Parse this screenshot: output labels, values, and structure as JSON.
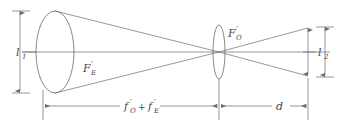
{
  "figure": {
    "name": "optical-ray-diagram",
    "background_color": "#ffffff",
    "line_color": "#6b6b6b",
    "label_color": "#4a4a4a"
  },
  "labels": {
    "left_height": {
      "base": "l",
      "sub": "1",
      "prime": ""
    },
    "right_height": {
      "base": "l",
      "sub": "2",
      "prime": ""
    },
    "eyepiece_focus": {
      "base": "F",
      "prime": "′",
      "sub": "E"
    },
    "objective_focus": {
      "base": "F",
      "prime": "′",
      "sub": "O"
    },
    "distance_sum": {
      "term1": {
        "base": "f",
        "prime": "′",
        "sub": "O"
      },
      "operator": "+",
      "term2": {
        "base": "f",
        "prime": "′",
        "sub": "E"
      }
    },
    "exit_distance": {
      "base": "d",
      "sub": "",
      "prime": ""
    }
  },
  "elements": {
    "left_aperture": "large-ellipse",
    "center_lens": "narrow-ellipse",
    "optical_axis": "horizontal-axis-line",
    "rays": "converging-diverging-ray-bundle"
  },
  "dimensions": {
    "left_vertical": "l1-dimension-arrow",
    "right_inner_vertical": "beam-height-arrow",
    "right_outer_vertical": "l2-dimension-arrow",
    "bottom_left_horizontal": "focal-sum-dimension",
    "bottom_right_horizontal": "d-dimension"
  }
}
